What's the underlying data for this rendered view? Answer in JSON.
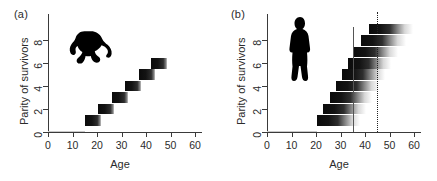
{
  "figure": {
    "width": 437,
    "height": 181,
    "background": "#ffffff",
    "ink": "#1a1a1a"
  },
  "panels": [
    {
      "id": "a",
      "label": "(a)",
      "species": "chimpanzee",
      "silhouette_icon": "chimpanzee-silhouette-icon"
    },
    {
      "id": "b",
      "label": "(b)",
      "species": "human",
      "silhouette_icon": "human-silhouette-icon"
    }
  ],
  "axes": {
    "xlabel": "Age",
    "ylabel": "Parity of survivors",
    "xticks": [
      0,
      10,
      20,
      30,
      40,
      50,
      60
    ],
    "yticks": [
      0,
      2,
      4,
      6,
      8
    ],
    "xlim": [
      0,
      62
    ],
    "ylim": [
      0,
      9.6
    ],
    "grid": false
  },
  "chart_data": [
    {
      "type": "bar",
      "orientation": "horizontal",
      "panel": "a",
      "title": "(a)",
      "xlabel": "Age",
      "ylabel": "Parity of survivors",
      "xlim": [
        0,
        62
      ],
      "ylim": [
        0,
        9.6
      ],
      "xticks": [
        0,
        10,
        20,
        30,
        40,
        50,
        60
      ],
      "yticks": [
        0,
        2,
        4,
        6,
        8
      ],
      "grid": false,
      "legend": "none",
      "note": "Chimpanzee: each parity level occupies a short age window; bars fade to the right.",
      "categories": [
        1,
        2,
        3,
        4,
        5,
        6
      ],
      "bars": [
        {
          "parity": 1,
          "start": 15.0,
          "solid_end": 20.0,
          "fade_end": 21.5
        },
        {
          "parity": 2,
          "start": 20.5,
          "solid_end": 25.5,
          "fade_end": 27.0
        },
        {
          "parity": 3,
          "start": 26.0,
          "solid_end": 31.0,
          "fade_end": 32.5
        },
        {
          "parity": 4,
          "start": 31.5,
          "solid_end": 36.5,
          "fade_end": 38.0
        },
        {
          "parity": 5,
          "start": 37.0,
          "solid_end": 42.0,
          "fade_end": 43.5
        },
        {
          "parity": 6,
          "start": 42.0,
          "solid_end": 47.0,
          "fade_end": 48.5
        }
      ],
      "baseline": {
        "parity": 0,
        "start": 0,
        "end": 15.0
      },
      "vlines": []
    },
    {
      "type": "bar",
      "orientation": "horizontal",
      "panel": "b",
      "title": "(b)",
      "xlabel": "Age",
      "ylabel": "Parity of survivors",
      "xlim": [
        0,
        62
      ],
      "ylim": [
        0,
        9.6
      ],
      "xticks": [
        0,
        10,
        20,
        30,
        40,
        50,
        60
      ],
      "yticks": [
        0,
        2,
        4,
        6,
        8
      ],
      "grid": false,
      "legend": "none",
      "note": "Human: parities accumulate from about age 20; long fading tails extend past the end of reproduction.",
      "categories": [
        1,
        2,
        3,
        4,
        5,
        6,
        7,
        8,
        9
      ],
      "bars": [
        {
          "parity": 1,
          "start": 20.5,
          "solid_end": 29.0,
          "fade_end": 38.0
        },
        {
          "parity": 2,
          "start": 23.0,
          "solid_end": 31.5,
          "fade_end": 40.5
        },
        {
          "parity": 3,
          "start": 25.5,
          "solid_end": 34.0,
          "fade_end": 43.0
        },
        {
          "parity": 4,
          "start": 28.0,
          "solid_end": 36.5,
          "fade_end": 45.5
        },
        {
          "parity": 5,
          "start": 30.5,
          "solid_end": 39.0,
          "fade_end": 48.0
        },
        {
          "parity": 6,
          "start": 33.0,
          "solid_end": 41.5,
          "fade_end": 50.5
        },
        {
          "parity": 7,
          "start": 35.5,
          "solid_end": 44.0,
          "fade_end": 53.5
        },
        {
          "parity": 8,
          "start": 38.5,
          "solid_end": 47.0,
          "fade_end": 56.5
        },
        {
          "parity": 9,
          "start": 41.5,
          "solid_end": 50.0,
          "fade_end": 59.5
        }
      ],
      "baseline": {
        "parity": 0,
        "start": 0,
        "end": 20.5
      },
      "vlines": [
        {
          "name": "end-of-reproduction-line",
          "x": 35,
          "style": "solid"
        },
        {
          "name": "menopause-line",
          "x": 45,
          "style": "dotted"
        }
      ]
    }
  ]
}
